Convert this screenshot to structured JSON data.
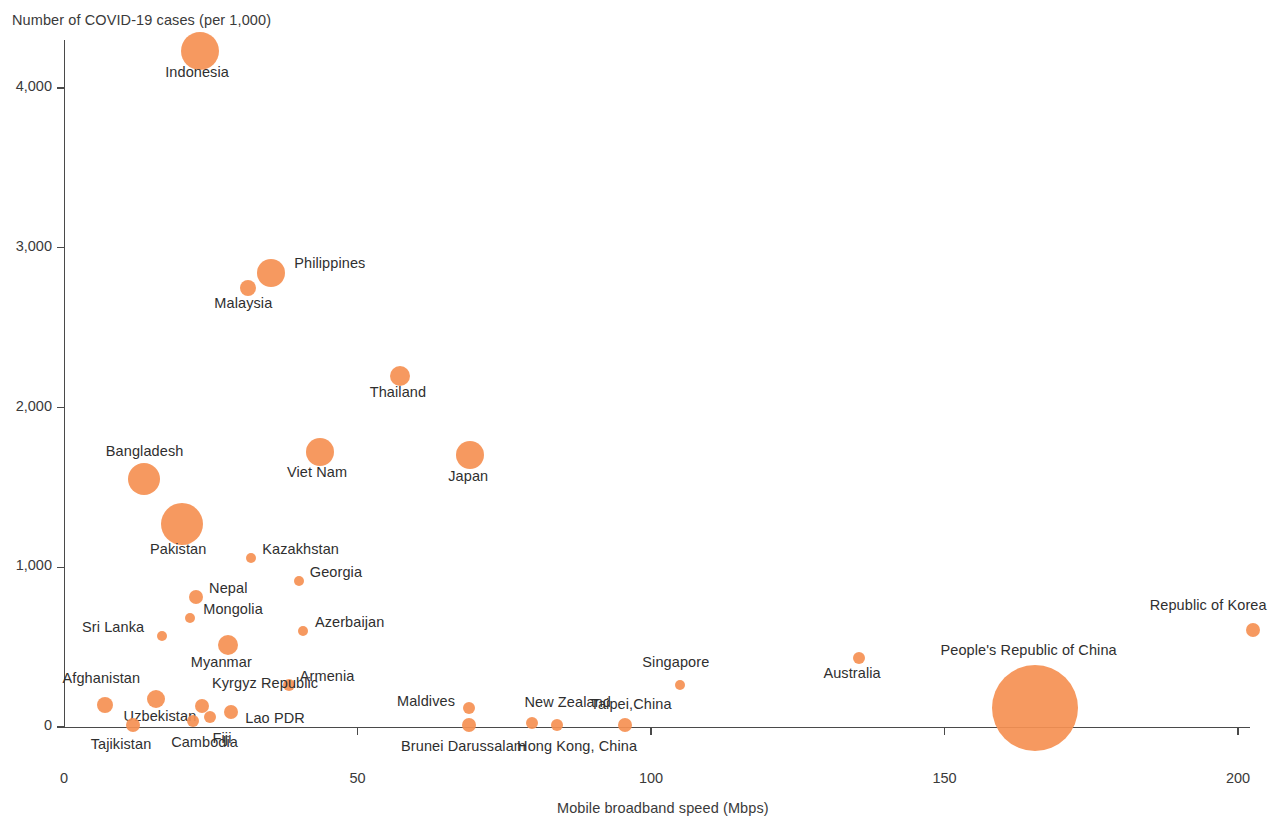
{
  "chart_data": {
    "type": "scatter",
    "title": "",
    "ylabel": "Number of COVID-19 cases (per 1,000)",
    "xlabel": "Mobile broadband speed (Mbps)",
    "xlim": [
      0,
      205
    ],
    "ylim": [
      0,
      4300
    ],
    "xticks": [
      0,
      50,
      100,
      150,
      200
    ],
    "xtick_labels": [
      "0",
      "50",
      "100",
      "150",
      "200"
    ],
    "yticks": [
      0,
      1000,
      2000,
      3000,
      4000
    ],
    "ytick_labels": [
      "0",
      "1,000",
      "2,000",
      "3,000",
      "4,000"
    ],
    "grid": false,
    "legend": "none",
    "bubble_color": "#f59052",
    "size_note": "bubble area encodes a third variable (population scale)",
    "points": [
      {
        "name": "Indonesia",
        "x": 23.2,
        "y": 4230,
        "r": 19,
        "label_dx": -35,
        "label_dy": 22
      },
      {
        "name": "Philippines",
        "x": 35.3,
        "y": 2840,
        "r": 14,
        "label_dx": 23,
        "label_dy": -9
      },
      {
        "name": "Malaysia",
        "x": 31.4,
        "y": 2745,
        "r": 8,
        "label_dx": -34,
        "label_dy": 16
      },
      {
        "name": "Thailand",
        "x": 57.2,
        "y": 2200,
        "r": 10,
        "label_dx": -30,
        "label_dy": 17
      },
      {
        "name": "Viet Nam",
        "x": 43.6,
        "y": 1720,
        "r": 14,
        "label_dx": -33,
        "label_dy": 21
      },
      {
        "name": "Japan",
        "x": 69.2,
        "y": 1705,
        "r": 14,
        "label_dx": -22,
        "label_dy": 22
      },
      {
        "name": "Bangladesh",
        "x": 13.6,
        "y": 1555,
        "r": 16,
        "label_dx": -38,
        "label_dy": -27
      },
      {
        "name": "Pakistan",
        "x": 20.1,
        "y": 1270,
        "r": 21,
        "label_dx": -32,
        "label_dy": 26
      },
      {
        "name": "Kazakhstan",
        "x": 31.9,
        "y": 1055,
        "r": 5,
        "label_dx": 11,
        "label_dy": -8
      },
      {
        "name": "Georgia",
        "x": 40.0,
        "y": 915,
        "r": 5,
        "label_dx": 11,
        "label_dy": -8
      },
      {
        "name": "Nepal",
        "x": 22.5,
        "y": 815,
        "r": 7,
        "label_dx": 13,
        "label_dy": -8
      },
      {
        "name": "Mongolia",
        "x": 21.5,
        "y": 685,
        "r": 5,
        "label_dx": 13,
        "label_dy": -8
      },
      {
        "name": "Sri Lanka",
        "x": 16.7,
        "y": 570,
        "r": 5,
        "label_dx": -80,
        "label_dy": -8
      },
      {
        "name": "Azerbaijan",
        "x": 40.7,
        "y": 600,
        "r": 5,
        "label_dx": 12,
        "label_dy": -8
      },
      {
        "name": "Myanmar",
        "x": 27.9,
        "y": 515,
        "r": 10,
        "label_dx": -37,
        "label_dy": 18
      },
      {
        "name": "Armenia",
        "x": 38.3,
        "y": 265,
        "r": 6,
        "label_dx": 11,
        "label_dy": -8
      },
      {
        "name": "Afghanistan",
        "x": 6.9,
        "y": 140,
        "r": 8,
        "label_dx": -42,
        "label_dy": -26
      },
      {
        "name": "Uzbekistan",
        "x": 15.6,
        "y": 175,
        "r": 9,
        "label_dx": -32,
        "label_dy": 18
      },
      {
        "name": "Kyrgyz Republic",
        "x": 23.5,
        "y": 130,
        "r": 7,
        "label_dx": 10,
        "label_dy": -22
      },
      {
        "name": "Lao PDR",
        "x": 28.5,
        "y": 95,
        "r": 7,
        "label_dx": 14,
        "label_dy": 7
      },
      {
        "name": "Tajikistan",
        "x": 11.7,
        "y": 10,
        "r": 7,
        "label_dx": -42,
        "label_dy": 20
      },
      {
        "name": "Cambodia",
        "x": 22.0,
        "y": 40,
        "r": 6,
        "label_dx": -22,
        "label_dy": 22
      },
      {
        "name": "Fiji",
        "x": 24.8,
        "y": 65,
        "r": 6,
        "label_dx": 3,
        "label_dy": 22
      },
      {
        "name": "Maldives",
        "x": 69.0,
        "y": 120,
        "r": 6,
        "label_dx": -72,
        "label_dy": -6
      },
      {
        "name": "Brunei Darussalam",
        "x": 69.0,
        "y": 15,
        "r": 7,
        "label_dx": -68,
        "label_dy": 22
      },
      {
        "name": "New Zealand",
        "x": 79.8,
        "y": 25,
        "r": 6,
        "label_dx": -8,
        "label_dy": -20
      },
      {
        "name": "Hong Kong, China",
        "x": 84.0,
        "y": 10,
        "r": 6,
        "label_dx": -40,
        "label_dy": 22
      },
      {
        "name": "Taipei,China",
        "x": 95.5,
        "y": 15,
        "r": 7,
        "label_dx": -34,
        "label_dy": -20
      },
      {
        "name": "Singapore",
        "x": 105.0,
        "y": 260,
        "r": 5,
        "label_dx": -38,
        "label_dy": -22
      },
      {
        "name": "Australia",
        "x": 135.5,
        "y": 435,
        "r": 6,
        "label_dx": -36,
        "label_dy": 16
      },
      {
        "name": "People's Republic of China",
        "x": 165.5,
        "y": 120,
        "r": 43,
        "label_dx": -95,
        "label_dy": -57
      },
      {
        "name": "Republic of Korea",
        "x": 202.5,
        "y": 605,
        "r": 7,
        "label_dx": -103,
        "label_dy": -24
      }
    ]
  }
}
